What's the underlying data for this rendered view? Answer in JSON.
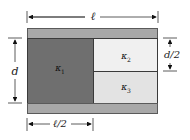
{
  "diagram": {
    "colors": {
      "plate": "#a8a8a8",
      "kappa1": "#6f6f6f",
      "kappa2": "#f0f0f0",
      "kappa3": "#e3e3e3",
      "lines": "#222222"
    },
    "dimensions": {
      "length_label": "ℓ",
      "half_length_label": "ℓ/2",
      "separation_label": "d",
      "half_separation_label": "d/2"
    },
    "regions": [
      {
        "id": "kappa1",
        "symbol": "κ",
        "subscript": "1",
        "position": "left half, full height"
      },
      {
        "id": "kappa2",
        "symbol": "κ",
        "subscript": "2",
        "position": "right half, upper"
      },
      {
        "id": "kappa3",
        "symbol": "κ",
        "subscript": "3",
        "position": "right half, lower"
      }
    ]
  }
}
